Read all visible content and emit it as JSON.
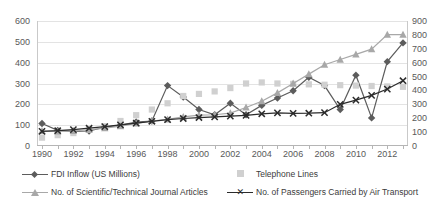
{
  "chart_data": {
    "type": "line",
    "title": "",
    "xlabel": "",
    "ylabel": "",
    "grid": true,
    "legend_position": "bottom",
    "x": [
      1990,
      1991,
      1992,
      1993,
      1994,
      1995,
      1996,
      1997,
      1998,
      1999,
      2000,
      2001,
      2002,
      2003,
      2004,
      2005,
      2006,
      2007,
      2008,
      2009,
      2010,
      2011,
      2012,
      2013
    ],
    "xtick_labels": [
      "1990",
      "1992",
      "1994",
      "1996",
      "1998",
      "2000",
      "2002",
      "2004",
      "2006",
      "2008",
      "2010",
      "2012"
    ],
    "left_axis": {
      "min": 0,
      "max": 600,
      "step": 100,
      "ticks": [
        "0",
        "100",
        "200",
        "300",
        "400",
        "500",
        "600"
      ]
    },
    "right_axis": {
      "min": 0,
      "max": 900,
      "step": 100,
      "ticks": [
        "0",
        "100",
        "200",
        "300",
        "400",
        "500",
        "600",
        "700",
        "800",
        "900"
      ]
    },
    "series": [
      {
        "name": "FDI Inflow (US Millions)",
        "axis": "left",
        "color": "#5c5c5c",
        "marker": "diamond",
        "has_line": true,
        "values": [
          108,
          75,
          70,
          72,
          90,
          100,
          115,
          120,
          290,
          235,
          175,
          150,
          205,
          150,
          195,
          230,
          265,
          330,
          290,
          175,
          340,
          135,
          405,
          495
        ]
      },
      {
        "name": "Telephone Lines",
        "axis": "left",
        "color": "#d0d0d0",
        "marker": "square",
        "has_line": false,
        "values": [
          40,
          52,
          62,
          78,
          95,
          120,
          148,
          175,
          205,
          240,
          250,
          262,
          278,
          300,
          305,
          300,
          298,
          296,
          294,
          292,
          290,
          288,
          286,
          284
        ]
      },
      {
        "name": "No. of Scientific/Technical Journal Articles",
        "axis": "left",
        "color": "#a8a8a8",
        "marker": "triangle",
        "has_line": true,
        "values": [
          72,
          70,
          72,
          78,
          86,
          95,
          108,
          120,
          128,
          140,
          148,
          150,
          158,
          185,
          215,
          255,
          300,
          345,
          390,
          415,
          440,
          465,
          535,
          535
        ]
      },
      {
        "name": "No. of Passengers Carried by Air Transport",
        "axis": "right",
        "color": "#2b2b2b",
        "marker": "x",
        "has_line": true,
        "values": [
          105,
          110,
          118,
          128,
          140,
          152,
          165,
          178,
          190,
          198,
          205,
          210,
          215,
          220,
          232,
          238,
          235,
          236,
          240,
          300,
          330,
          365,
          410,
          470
        ]
      }
    ]
  },
  "legend": {
    "items": [
      {
        "label": "FDI Inflow (US Millions)"
      },
      {
        "label": "Telephone Lines"
      },
      {
        "label": "No. of Scientific/Technical Journal Articles"
      },
      {
        "label": "No. of Passengers Carried by Air Transport"
      }
    ]
  }
}
